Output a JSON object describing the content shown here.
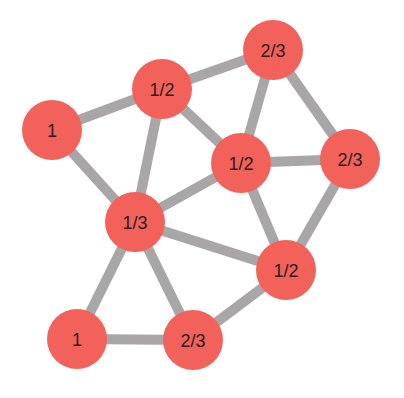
{
  "diagram": {
    "type": "graph",
    "node_color": "#f2615a",
    "edge_color": "#a9a6a8",
    "node_radius": 30,
    "nodes": [
      {
        "id": "A",
        "label": "1",
        "x": 52,
        "y": 130
      },
      {
        "id": "B",
        "label": "1/2",
        "x": 162,
        "y": 89
      },
      {
        "id": "C",
        "label": "2/3",
        "x": 273,
        "y": 50
      },
      {
        "id": "D",
        "label": "1/2",
        "x": 241,
        "y": 163
      },
      {
        "id": "E",
        "label": "2/3",
        "x": 350,
        "y": 159
      },
      {
        "id": "F",
        "label": "1/3",
        "x": 135,
        "y": 222
      },
      {
        "id": "G",
        "label": "1/2",
        "x": 286,
        "y": 270
      },
      {
        "id": "H",
        "label": "1",
        "x": 77,
        "y": 339
      },
      {
        "id": "I",
        "label": "2/3",
        "x": 193,
        "y": 340
      }
    ],
    "edges": [
      [
        "A",
        "B"
      ],
      [
        "A",
        "F"
      ],
      [
        "B",
        "C"
      ],
      [
        "B",
        "D"
      ],
      [
        "B",
        "F"
      ],
      [
        "C",
        "D"
      ],
      [
        "C",
        "E"
      ],
      [
        "D",
        "E"
      ],
      [
        "D",
        "F"
      ],
      [
        "D",
        "G"
      ],
      [
        "E",
        "G"
      ],
      [
        "F",
        "G"
      ],
      [
        "F",
        "H"
      ],
      [
        "F",
        "I"
      ],
      [
        "H",
        "I"
      ],
      [
        "I",
        "G"
      ]
    ]
  }
}
